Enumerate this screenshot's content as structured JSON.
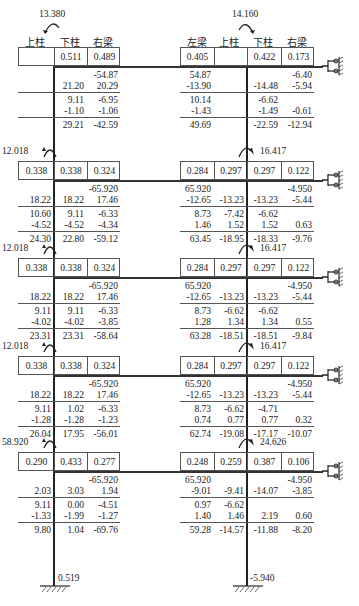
{
  "headers": {
    "left": [
      "上柱",
      "下柱",
      "右梁"
    ],
    "right": [
      "左梁",
      "上柱",
      "下柱",
      "右梁"
    ]
  },
  "top_moments": {
    "left": "13.380",
    "right": "14.160"
  },
  "floors": [
    {
      "left_moment": "",
      "right_moment": "",
      "left_factors": [
        "",
        "0.511",
        "0.489"
      ],
      "right_factors": [
        "0.405",
        "",
        "0.422",
        "0.173"
      ],
      "left_rows": [
        [
          "",
          "",
          "-54.87"
        ],
        [
          "",
          "21.20",
          "20.29"
        ],
        [
          "",
          "9.11",
          "-6.95"
        ],
        [
          "",
          "-1.10",
          "-1.06"
        ],
        [
          "",
          "29.21",
          "-42.59"
        ]
      ],
      "right_rows": [
        [
          "54.87",
          "",
          "",
          "-6.40"
        ],
        [
          "-13.90",
          "",
          "-14.48",
          "-5.94"
        ],
        [
          "10.14",
          "",
          "-6.62",
          ""
        ],
        [
          "-1.43",
          "",
          "-1.49",
          "-0.61"
        ],
        [
          "49.69",
          "",
          "-22.59",
          "-12.94"
        ]
      ]
    },
    {
      "left_moment": "12.018",
      "right_moment": "16.417",
      "left_factors": [
        "0.338",
        "0.338",
        "0.324"
      ],
      "right_factors": [
        "0.284",
        "0.297",
        "0.297",
        "0.122"
      ],
      "left_rows": [
        [
          "",
          "",
          "-65.920"
        ],
        [
          "18.22",
          "18.22",
          "17.46"
        ],
        [
          "10.60",
          "9.11",
          "-6.33"
        ],
        [
          "-4.52",
          "-4.52",
          "-4.34"
        ],
        [
          "24.30",
          "22.80",
          "-59.12"
        ]
      ],
      "right_rows": [
        [
          "65.920",
          "",
          "",
          "-4.950"
        ],
        [
          "-12.65",
          "-13.23",
          "-13.23",
          "-5.44"
        ],
        [
          "8.73",
          "-7.42",
          "-6.62",
          ""
        ],
        [
          "1.46",
          "1.52",
          "1.52",
          "0.63"
        ],
        [
          "63.45",
          "-18.95",
          "-18.33",
          "-9.76"
        ]
      ]
    },
    {
      "left_moment": "12.018",
      "right_moment": "16.417",
      "left_factors": [
        "0.338",
        "0.338",
        "0.324"
      ],
      "right_factors": [
        "0.284",
        "0.297",
        "0.297",
        "0.122"
      ],
      "left_rows": [
        [
          "",
          "",
          "-65.920"
        ],
        [
          "18.22",
          "18.22",
          "17.46"
        ],
        [
          "9.11",
          "9.11",
          "-6.33"
        ],
        [
          "-4.02",
          "-4.02",
          "-3.85"
        ],
        [
          "23.31",
          "23.31",
          "-58.64"
        ]
      ],
      "right_rows": [
        [
          "65.920",
          "",
          "",
          "-4.950"
        ],
        [
          "-12.65",
          "-13.23",
          "-13.23",
          "-5.44"
        ],
        [
          "8.73",
          "-6.62",
          "-6.62",
          ""
        ],
        [
          "1.28",
          "1.34",
          "1.34",
          "0.55"
        ],
        [
          "63.28",
          "-18.51",
          "-18.51",
          "-9.84"
        ]
      ]
    },
    {
      "left_moment": "12.018",
      "right_moment": "16.417",
      "left_factors": [
        "0.338",
        "0.338",
        "0.324"
      ],
      "right_factors": [
        "0.284",
        "0.297",
        "0.297",
        "0.122"
      ],
      "left_rows": [
        [
          "",
          "",
          "-65.920"
        ],
        [
          "18.22",
          "18.22",
          "17.46"
        ],
        [
          "9.11",
          "1.02",
          "-6.33"
        ],
        [
          "-1.28",
          "-1.28",
          "-1.23"
        ],
        [
          "26.04",
          "17.95",
          "-56.01"
        ]
      ],
      "right_rows": [
        [
          "65.920",
          "",
          "",
          "-4.950"
        ],
        [
          "-12.65",
          "-13.23",
          "-13.23",
          "-5.44"
        ],
        [
          "8.73",
          "-6.62",
          "-4.71",
          ""
        ],
        [
          "0.74",
          "0.77",
          "0.77",
          "0.32"
        ],
        [
          "62.74",
          "-19.08",
          "-17.17",
          "-10.07"
        ]
      ]
    },
    {
      "left_moment": "58.920",
      "right_moment": "24.626",
      "left_factors": [
        "0.290",
        "0.433",
        "0.277"
      ],
      "right_factors": [
        "0.248",
        "0.259",
        "0.387",
        "0.106"
      ],
      "left_rows": [
        [
          "",
          "",
          "-65.920"
        ],
        [
          "2.03",
          "3.03",
          "1.94"
        ],
        [
          "9.11",
          "0.00",
          "-4.51"
        ],
        [
          "-1.33",
          "-1.99",
          "-1.27"
        ],
        [
          "9.80",
          "1.04",
          "-69.76"
        ]
      ],
      "right_rows": [
        [
          "65.920",
          "",
          "",
          "-4.950"
        ],
        [
          "-9.01",
          "-9.41",
          "-14.07",
          "-3.85"
        ],
        [
          "0.97",
          "-6.62",
          "",
          ""
        ],
        [
          "1.40",
          "1.46",
          "2.19",
          "0.60"
        ],
        [
          "59.28",
          "-14.57",
          "-11.88",
          "-8.20"
        ]
      ]
    }
  ],
  "base_moments": {
    "left": "0.519",
    "right": "-5.940"
  },
  "colors": {
    "line": "#222222",
    "box": "#555555",
    "text": "#222222"
  }
}
